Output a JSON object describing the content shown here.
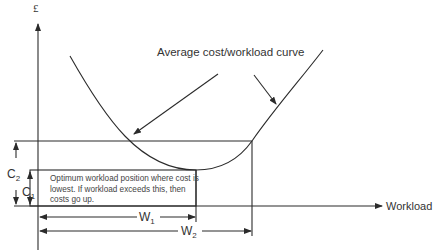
{
  "diagram": {
    "y_axis_label": "£",
    "x_axis_label": "Workload",
    "curve_label": "Average cost/workload curve",
    "note": "Optimum workload position where cost is lowest. If workload exceeds this, then costs go up.",
    "dimensions": {
      "c2": {
        "letter": "C",
        "sub": "2"
      },
      "c1": {
        "letter": "C",
        "sub": "1"
      },
      "w1": {
        "letter": "W",
        "sub": "1"
      },
      "w2": {
        "letter": "W",
        "sub": "2"
      }
    },
    "colors": {
      "line": "#2b2b2b",
      "text": "#333333",
      "background": "#ffffff"
    }
  }
}
